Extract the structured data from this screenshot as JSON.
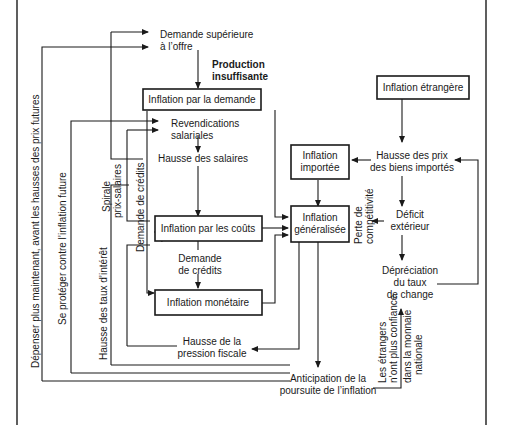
{
  "diagram": {
    "nodes": {
      "demande_sup": {
        "line1": "Demande supérieure",
        "line2": "à l’offre"
      },
      "production": {
        "line1": "Production",
        "line2": "insuffisante"
      },
      "infl_demande": {
        "label": "Inflation par la demande"
      },
      "infl_etrangere": {
        "label": "Inflation étrangère"
      },
      "revendications": {
        "line1": "Revendications",
        "line2": "salariales"
      },
      "hausse_salaires": {
        "label": "Hausse des salaires"
      },
      "infl_importee": {
        "line1": "Inflation",
        "line2": "importée"
      },
      "hausse_prix_importes": {
        "line1": "Hausse des prix",
        "line2": "des biens importés"
      },
      "infl_couts": {
        "label": "Inflation par les coûts"
      },
      "infl_generalisee": {
        "line1": "Inflation",
        "line2": "généralisée"
      },
      "deficit": {
        "line1": "Déficit",
        "line2": "extérieur"
      },
      "demande_credits": {
        "line1": "Demande",
        "line2": "de crédits"
      },
      "depreciation": {
        "line1": "Dépréciation",
        "line2": "du taux",
        "line3": "de change"
      },
      "infl_monetaire": {
        "label": "Inflation monétaire"
      },
      "pression_fiscale": {
        "line1": "Hausse de la",
        "line2": "pression fiscale"
      },
      "anticipation": {
        "line1": "Anticipation de la",
        "line2": "poursuite de l’inflation"
      }
    },
    "vertical_labels": {
      "depenser": "Dépenser plus maintenant, avant les hausses des prix futures",
      "se_proteger": "Se protéger contre l’inflation future",
      "hausse_taux": "Hausse des taux d’intérêt",
      "spirale_1": "Spirale",
      "spirale_2": "prix-salaires",
      "demande_credits_v": "Demande de crédits",
      "perte_1": "Perte de",
      "perte_2": "compétitivité",
      "etrangers_1": "Les étrangers",
      "etrangers_2": "n’ont plus confiance",
      "etrangers_3": "dans la monnaie",
      "etrangers_4": "nationale"
    }
  }
}
